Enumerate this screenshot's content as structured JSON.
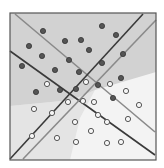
{
  "diagram": {
    "type": "scatter-with-decision-boundaries",
    "frame": {
      "x": 10,
      "y": 13,
      "width": 146,
      "height": 147,
      "stroke": "#555555"
    },
    "regions": [
      {
        "name": "lower-light-region",
        "fill": "#f3f3f3",
        "points": "10,13 156,13 156,160 10,160"
      },
      {
        "name": "middle-region",
        "fill": "#e4e4e4",
        "points": "10,106 72,100 95,90 80,118 70,160 10,160"
      },
      {
        "name": "upper-dark-region",
        "fill": "#d2d2d2",
        "points": "10,13 156,13 156,72 95,90 72,100 10,106"
      }
    ],
    "lines": [
      {
        "name": "light-line-descending",
        "x1": 15,
        "y1": 14,
        "x2": 155,
        "y2": 132,
        "stroke": "#8a8a8a",
        "width": 1.6
      },
      {
        "name": "dark-line-descending",
        "x1": 10,
        "y1": 51,
        "x2": 155,
        "y2": 155,
        "stroke": "#3a3a3a",
        "width": 1.6
      },
      {
        "name": "dark-line-ascending",
        "x1": 10,
        "y1": 159,
        "x2": 143,
        "y2": 14,
        "stroke": "#3a3a3a",
        "width": 1.6
      },
      {
        "name": "light-line-ascending",
        "x1": 23,
        "y1": 159,
        "x2": 156,
        "y2": 20,
        "stroke": "#8a8a8a",
        "width": 1.6
      }
    ],
    "filled_points": [
      [
        43,
        31
      ],
      [
        102,
        26
      ],
      [
        116,
        35
      ],
      [
        29,
        46
      ],
      [
        65,
        41
      ],
      [
        81,
        40
      ],
      [
        89,
        50
      ],
      [
        42,
        56
      ],
      [
        69,
        60
      ],
      [
        123,
        54
      ],
      [
        22,
        66
      ],
      [
        55,
        70
      ],
      [
        79,
        72
      ],
      [
        102,
        63
      ],
      [
        121,
        78
      ],
      [
        36,
        92
      ],
      [
        60,
        90
      ],
      [
        76,
        89
      ],
      [
        98,
        85
      ],
      [
        113,
        98
      ]
    ],
    "hollow_points": [
      [
        47,
        84
      ],
      [
        86,
        82
      ],
      [
        110,
        84
      ],
      [
        126,
        91
      ],
      [
        34,
        109
      ],
      [
        68,
        102
      ],
      [
        83,
        101
      ],
      [
        94,
        102
      ],
      [
        139,
        105
      ],
      [
        52,
        113
      ],
      [
        98,
        115
      ],
      [
        128,
        119
      ],
      [
        75,
        122
      ],
      [
        107,
        122
      ],
      [
        32,
        136
      ],
      [
        57,
        138
      ],
      [
        91,
        131
      ],
      [
        76,
        142
      ],
      [
        107,
        143
      ],
      [
        121,
        142
      ]
    ],
    "point_style": {
      "filled_fill": "#555555",
      "filled_stroke": "#333333",
      "hollow_fill": "#f6f6f6",
      "hollow_stroke": "#555555",
      "radius": 2.6
    }
  }
}
